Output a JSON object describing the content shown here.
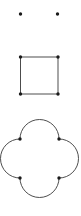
{
  "figure": {
    "background_color": "#ffffff",
    "stroke_color": "#3a3a3a",
    "vertex_color": "#1a1a1a",
    "width": 81,
    "height": 216,
    "panels": [
      {
        "name": "two-points",
        "description": "Two isolated points",
        "points": [
          {
            "x": 20.5,
            "y": 14.0,
            "r": 1.7
          },
          {
            "x": 57.5,
            "y": 14.0,
            "r": 1.7
          }
        ]
      },
      {
        "name": "square",
        "description": "Square outline with four corner vertices",
        "x0": 20.5,
        "y0": 57.0,
        "x1": 58.0,
        "y1": 94.0,
        "stroke_width": 0.9,
        "vertices": [
          {
            "x": 20.5,
            "y": 57.0,
            "r": 1.7
          },
          {
            "x": 58.0,
            "y": 57.0,
            "r": 1.7
          },
          {
            "x": 58.0,
            "y": 94.0,
            "r": 1.7
          },
          {
            "x": 20.5,
            "y": 94.0,
            "r": 1.7
          }
        ]
      },
      {
        "name": "quatrefoil",
        "description": "Four outward semicircular arcs on the sides of a square, forming a four-petal rosette",
        "x0": 20.0,
        "y0": 139.0,
        "x1": 59.0,
        "y1": 178.0,
        "arc_radius": 19.5,
        "stroke_width": 0.9,
        "bounds": {
          "left": 1.0,
          "top": 120.0,
          "right": 78.0,
          "bottom": 197.0
        },
        "vertices": [
          {
            "x": 20.0,
            "y": 139.0,
            "r": 1.7
          },
          {
            "x": 59.0,
            "y": 139.0,
            "r": 1.7
          },
          {
            "x": 59.0,
            "y": 178.0,
            "r": 1.7
          },
          {
            "x": 20.0,
            "y": 178.0,
            "r": 1.7
          }
        ]
      }
    ]
  }
}
